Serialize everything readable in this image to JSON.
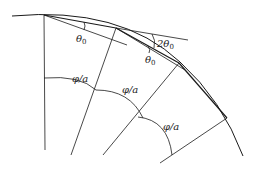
{
  "diagram": {
    "stroke_color": "#1a1a1a",
    "labels": {
      "theta0_first": {
        "main": "θ",
        "sub": "0"
      },
      "theta0_second": {
        "main": "θ",
        "sub": "0"
      },
      "two_theta0": {
        "main": "2θ",
        "sub": "0"
      },
      "phi_over_a_1": "φ/a",
      "phi_over_a_2": "φ/a",
      "phi_over_a_3": "φ/a"
    }
  }
}
